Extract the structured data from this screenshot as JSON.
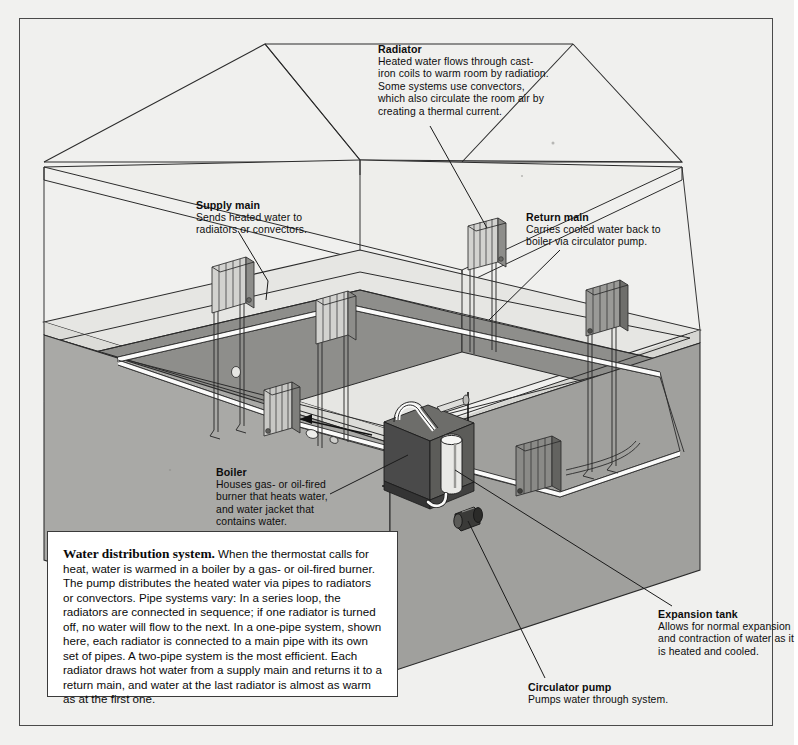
{
  "diagram": {
    "title": "Water distribution system",
    "type": "cutaway-isometric-illustration"
  },
  "caption": {
    "lead": "Water distribution system.",
    "body": " When the thermostat calls for heat, water is warmed in a boiler by a gas- or oil-fired burner. The pump distributes the heated water via pipes to radiators or convectors. Pipe systems vary: In a series loop, the radiators are connected in sequence; if one radiator is turned off, no water will flow to the next. In a one-pipe system, shown here, each radiator is connected to a main pipe with its own set of pipes. A two-pipe system is the most efficient. Each radiator draws hot water from a supply main and returns it to a return main, and water at the last radiator is almost as warm as at the first one."
  },
  "callouts": [
    {
      "id": "radiator",
      "heading": "Radiator",
      "body": "Heated water flows through cast-\niron coils to warm room by radiation.\nSome systems use convectors,\nwhich also circulate the room air by\ncreating a thermal current."
    },
    {
      "id": "supply-main",
      "heading": "Supply main",
      "body": "Sends heated water to\nradiators or convectors."
    },
    {
      "id": "return-main",
      "heading": "Return main",
      "body": "Carries cooled water back to\nboiler via circulator pump."
    },
    {
      "id": "boiler",
      "heading": "Boiler",
      "body": "Houses gas- or oil-fired\nburner that heats water,\nand water jacket that\ncontains water."
    },
    {
      "id": "expansion-tank",
      "heading": "Expansion tank",
      "body": "Allows for normal expansion\nand contraction of water as it\nis heated and cooled."
    },
    {
      "id": "circulator-pump",
      "heading": "Circulator pump",
      "body": "Pumps water through system."
    }
  ],
  "components": {
    "radiators_upper_count": 4,
    "radiators_basement_count": 2,
    "boiler": "dark rectangular cabinet",
    "expansion_tank": "vertical cylinder atop boiler",
    "circulator_pump": "small dark inline cylinder on return line",
    "flow_arrows": 2
  },
  "colors": {
    "page_background": "#f1f1ef",
    "frame_rule": "#4a4a4a",
    "line": "#1a1a1a",
    "wall_light": "#e9e9e6",
    "floor_mid": "#d8d8d4",
    "foundation": "#a9a9a6",
    "basement_back": "#8f8f8c",
    "boiler_dark": "#4b4b4b",
    "boiler_face": "#626262",
    "radiator_light": "#c9c9c6",
    "radiator_dark": "#75757",
    "pipe_white": "#fdfdfd",
    "caption_bg": "#ffffff",
    "text": "#0d0d0d"
  }
}
